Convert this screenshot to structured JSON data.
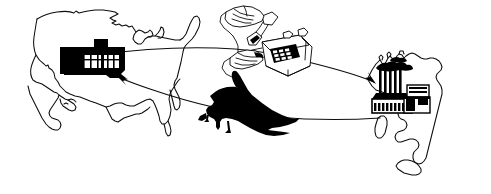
{
  "illustration": {
    "title": "International trade flow illustration",
    "style": "black-and-white line art clip art",
    "background_color": "#ffffff",
    "ink_color": "#000000",
    "width": 491,
    "height": 194
  },
  "elements": {
    "us_map": {
      "name": "United States map outline",
      "icon": "us-map-outline-icon",
      "fill": "none",
      "stroke": "#000000"
    },
    "us_building": {
      "name": "Retail store / warehouse building",
      "icon": "building-icon",
      "fill": "#000000",
      "window_fill": "#ffffff",
      "detail": "low flat building with white window mullions and rooftop unit"
    },
    "telephone": {
      "name": "Hand dialing desk telephone",
      "icon": "telephone-icon",
      "fill": "#ffffff",
      "stroke": "#000000",
      "detail": "push-button desk phone with handset held by a hand"
    },
    "airplane": {
      "name": "Cargo airplane silhouette",
      "icon": "airplane-icon",
      "fill": "#000000",
      "detail": "jet airliner in flight, landing gear down"
    },
    "italy_map": {
      "name": "Italy map outline",
      "icon": "italy-map-outline-icon",
      "fill": "none",
      "stroke": "#000000",
      "detail": "Italian peninsula with Sardinia and Sicily"
    },
    "italy_factory": {
      "name": "Factory with smokestacks",
      "icon": "factory-icon",
      "fill": "#000000",
      "smokestack_count": 5,
      "detail": "industrial plant with five smoking chimneys and annex buildings"
    }
  },
  "flows": [
    {
      "id": "order-flow",
      "name": "Order placed from US to Italy",
      "from": "us_building",
      "via": "telephone",
      "to": "italy_factory",
      "direction": "west-to-east",
      "arrow": "arrowhead-right-down-icon"
    },
    {
      "id": "shipment-flow",
      "name": "Goods shipped from Italy to US",
      "from": "italy_factory",
      "via": "airplane",
      "to": "us_building",
      "direction": "east-to-west",
      "arrow": "arrowhead-left-up-icon"
    }
  ],
  "labels": {
    "none_visible": ""
  }
}
